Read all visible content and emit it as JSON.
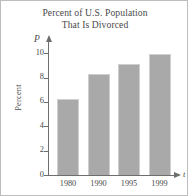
{
  "chart_data": {
    "type": "bar",
    "title": "Percent of U.S. Population That Is Divorced",
    "title_lines": [
      "Percent of U.S. Population",
      "That Is Divorced"
    ],
    "categories": [
      "1980",
      "1990",
      "1995",
      "1999"
    ],
    "values": [
      6.2,
      8.3,
      9.1,
      9.9
    ],
    "xlabel": "t",
    "ylabel": "Percent",
    "yaxis_symbol": "P",
    "xaxis_symbol": "t",
    "ylim": [
      0,
      11
    ],
    "yticks": [
      0,
      2,
      4,
      6,
      8,
      10
    ],
    "ytick_labels": [
      "0",
      "2",
      "4",
      "6",
      "8",
      "10"
    ],
    "grid": false,
    "legend": false,
    "bar_color": "#a9a9a9",
    "axis_color": "#6e6e6e",
    "text_color": "#4a4a4a"
  }
}
